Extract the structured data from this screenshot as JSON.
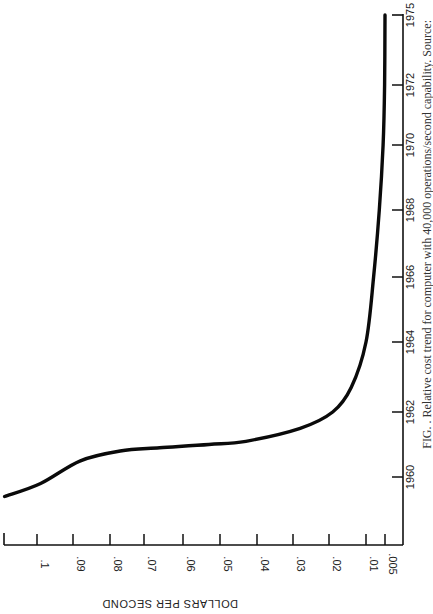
{
  "chart_data": {
    "type": "line",
    "orientation": "rotated-90-clockwise",
    "title": "",
    "xlabel": "",
    "ylabel": "DOLLARS PER SECOND",
    "caption": "FIG. . Relative cost trend for computer with 40,000 operations/second capability. Source:",
    "x_ticks": [
      "1960",
      "1962",
      "1964",
      "1966",
      "1968",
      "1970",
      "1972",
      "1975"
    ],
    "y_ticks": [
      ".1",
      ".09",
      ".08",
      ".07",
      ".06",
      ".05",
      ".04",
      ".03",
      ".02",
      ".01",
      ".005"
    ],
    "y_tick_values": [
      0.1,
      0.09,
      0.08,
      0.07,
      0.06,
      0.05,
      0.04,
      0.03,
      0.02,
      0.01,
      0.005
    ],
    "xlim": [
      1958.8,
      1975
    ],
    "ylim": [
      0,
      0.11
    ],
    "grid": false,
    "legend": "none",
    "series": [
      {
        "name": "cost per second",
        "x": [
          1959.4,
          1959.8,
          1960.5,
          1960.8,
          1960.9,
          1961.0,
          1961.1,
          1961.5,
          1962.0,
          1962.7,
          1964.0,
          1966.0,
          1968.0,
          1970.0,
          1972.0,
          1975.0
        ],
        "y": [
          0.109,
          0.099,
          0.088,
          0.077,
          0.066,
          0.053,
          0.043,
          0.028,
          0.019,
          0.014,
          0.01,
          0.008,
          0.0065,
          0.0055,
          0.0051,
          0.005
        ]
      }
    ]
  }
}
